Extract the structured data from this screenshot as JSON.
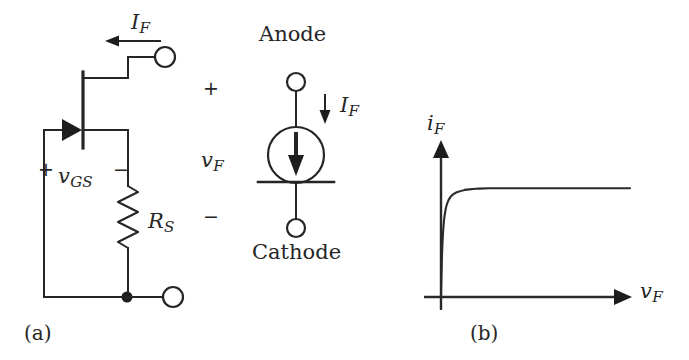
{
  "figure": {
    "type": "circuit-schematic",
    "panels": [
      {
        "id": "a",
        "caption": "(a)",
        "title": "JFET current source circuit",
        "labels": {
          "drain_current": "I",
          "drain_current_sub": "F",
          "gate_source_voltage": "v",
          "gate_source_voltage_sub": "GS",
          "source_resistor": "R",
          "source_resistor_sub": "S",
          "terminal_voltage": "v",
          "terminal_voltage_sub": "F",
          "plus_top": "+",
          "minus_bottom": "−",
          "plus_gs": "+",
          "minus_gs": "−"
        }
      },
      {
        "id": "a2",
        "caption": "",
        "title": "Current regulator diode symbol",
        "labels": {
          "anode": "Anode",
          "cathode": "Cathode",
          "forward_current": "I",
          "forward_current_sub": "F"
        }
      },
      {
        "id": "b",
        "caption": "(b)",
        "title": "Forward I-V characteristic",
        "labels": {
          "y_axis": "i",
          "y_axis_sub": "F",
          "x_axis": "v",
          "x_axis_sub": "F"
        }
      }
    ]
  },
  "chart_data": {
    "type": "line",
    "title": "",
    "xlabel": "vF",
    "ylabel": "iF",
    "grid": false,
    "legend": null,
    "xlim": [
      0,
      10
    ],
    "ylim": [
      0,
      1.15
    ],
    "series": [
      {
        "name": "forward characteristic",
        "x": [
          0.0,
          0.05,
          0.1,
          0.17,
          0.25,
          0.35,
          0.5,
          0.7,
          0.95,
          1.25,
          1.6,
          2.0,
          2.6,
          3.4,
          4.5,
          6.0,
          8.0,
          10.0
        ],
        "y": [
          0.0,
          0.36,
          0.57,
          0.72,
          0.81,
          0.87,
          0.92,
          0.95,
          0.97,
          0.985,
          0.993,
          0.997,
          1.0,
          1.0,
          1.0,
          1.0,
          1.0,
          1.0
        ]
      }
    ]
  },
  "colors": {
    "ink": "#252525",
    "background": "#ffffff"
  }
}
